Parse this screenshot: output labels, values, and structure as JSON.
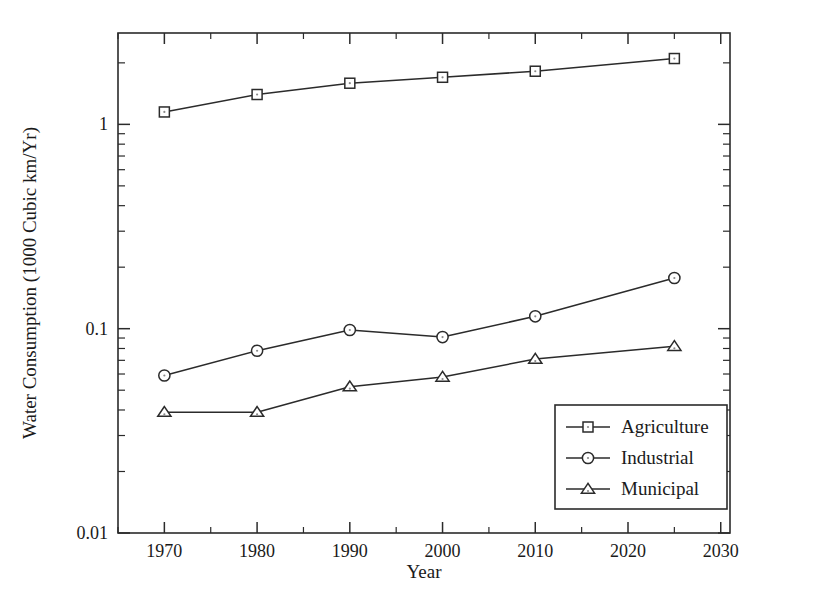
{
  "chart_data": {
    "type": "line",
    "title": "",
    "xlabel": "Year",
    "ylabel": "Water Consumption (1000 Cubic km/Yr)",
    "x": [
      1970,
      1980,
      1990,
      2000,
      2010,
      2025
    ],
    "xlim": [
      1965,
      2031
    ],
    "ylim": [
      0.01,
      2.8
    ],
    "yscale": "log",
    "grid": false,
    "legend_position": "lower right",
    "xticks": [
      1970,
      1980,
      1990,
      2000,
      2010,
      2020,
      2030
    ],
    "xtick_labels": [
      "1970",
      "1980",
      "1990",
      "2000",
      "2010",
      "2020",
      "2030"
    ],
    "yticks": [
      0.01,
      0.1,
      1
    ],
    "ytick_labels": [
      "0.01",
      "0.1",
      "1"
    ],
    "series": [
      {
        "name": "Agriculture",
        "marker": "square",
        "values": [
          1.15,
          1.4,
          1.59,
          1.7,
          1.82,
          2.1
        ]
      },
      {
        "name": "Industrial",
        "marker": "circle",
        "values": [
          0.059,
          0.078,
          0.0985,
          0.091,
          0.115,
          0.177
        ]
      },
      {
        "name": "Municipal",
        "marker": "triangle",
        "values": [
          0.039,
          0.039,
          0.052,
          0.058,
          0.071,
          0.082
        ]
      }
    ]
  },
  "colors": {
    "line": "#2b2b2b",
    "marker_fill": "#ffffff",
    "text": "#1a1a1a",
    "background": "#ffffff"
  },
  "legend": {
    "entries": [
      {
        "label": "Agriculture",
        "marker": "square"
      },
      {
        "label": "Industrial",
        "marker": "circle"
      },
      {
        "label": "Municipal",
        "marker": "triangle"
      }
    ]
  }
}
